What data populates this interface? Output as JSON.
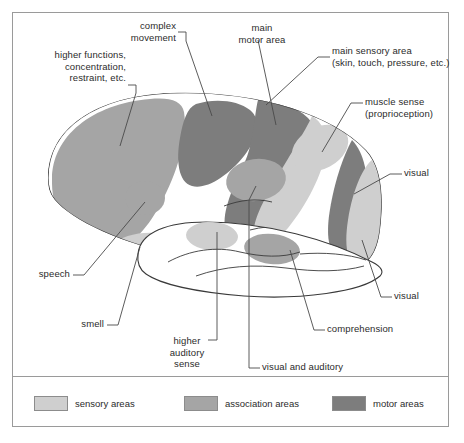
{
  "figure": {
    "frame_border_color": "#9a9a9a",
    "background_color": "#ffffff",
    "outline_color": "#3a3a3a"
  },
  "colors": {
    "sensory": "#cfcfcf",
    "association": "#a5a5a5",
    "motor": "#7d7d7d",
    "white_matter": "#ffffff",
    "stroke": "#3a3a3a",
    "leader_line": "#4a4a4a",
    "text": "#2b2b2b"
  },
  "labels": [
    {
      "name": "higher-functions",
      "text": "higher functions,\nconcentration,\nrestraint, etc.",
      "align": "right",
      "x": 20,
      "y": 49,
      "width": 106
    },
    {
      "name": "complex-movement",
      "text": "complex\nmovement",
      "align": "right",
      "x": 104,
      "y": 20,
      "width": 72
    },
    {
      "name": "main-motor-area",
      "text": "main\nmotor area",
      "align": "center",
      "x": 231,
      "y": 22,
      "width": 62
    },
    {
      "name": "main-sensory-area",
      "text": "main sensory area\n(skin, touch, pressure, etc.)",
      "align": "left",
      "x": 332,
      "y": 45,
      "width": 128
    },
    {
      "name": "muscle-sense",
      "text": "muscle sense\n(proprioception)",
      "align": "left",
      "x": 365,
      "y": 96,
      "width": 96
    },
    {
      "name": "visual-upper",
      "text": "visual",
      "align": "left",
      "x": 404,
      "y": 167,
      "width": 44
    },
    {
      "name": "visual-lower",
      "text": "visual",
      "align": "left",
      "x": 394,
      "y": 290,
      "width": 44
    },
    {
      "name": "comprehension",
      "text": "comprehension",
      "align": "left",
      "x": 327,
      "y": 323,
      "width": 86
    },
    {
      "name": "visual-and-auditory",
      "text": "visual and auditory",
      "align": "left",
      "x": 262,
      "y": 361,
      "width": 104
    },
    {
      "name": "higher-auditory-sense",
      "text": "higher\nauditory\nsense",
      "align": "center",
      "x": 160,
      "y": 335,
      "width": 54
    },
    {
      "name": "smell",
      "text": "smell",
      "align": "right",
      "x": 60,
      "y": 318,
      "width": 44
    },
    {
      "name": "speech",
      "text": "speech",
      "align": "right",
      "x": 22,
      "y": 268,
      "width": 48
    }
  ],
  "legend": {
    "items": [
      {
        "name": "sensory-areas",
        "label": "sensory areas",
        "color": "#cfcfcf",
        "x": 22
      },
      {
        "name": "association-areas",
        "label": "association areas",
        "color": "#a5a5a5",
        "x": 172
      },
      {
        "name": "motor-areas",
        "label": "motor areas",
        "color": "#7d7d7d",
        "x": 320
      }
    ]
  },
  "regions": [
    {
      "name": "prefrontal-association",
      "category": "association",
      "label_ref": "higher-functions"
    },
    {
      "name": "premotor-complex-movement",
      "category": "motor",
      "label_ref": "complex-movement"
    },
    {
      "name": "primary-motor-cortex",
      "category": "motor",
      "label_ref": "main-motor-area"
    },
    {
      "name": "primary-somatosensory-cortex",
      "category": "sensory",
      "label_ref": "main-sensory-area"
    },
    {
      "name": "proprioception-area",
      "category": "sensory",
      "label_ref": "muscle-sense"
    },
    {
      "name": "visual-association-upper",
      "category": "association",
      "label_ref": "visual-upper"
    },
    {
      "name": "primary-visual-cortex",
      "category": "sensory",
      "label_ref": "visual-lower"
    },
    {
      "name": "occipital-motor-band",
      "category": "motor",
      "label_ref": "visual-upper"
    },
    {
      "name": "comprehension-area",
      "category": "association",
      "label_ref": "comprehension"
    },
    {
      "name": "visual-and-auditory-area",
      "category": "association",
      "label_ref": "visual-and-auditory"
    },
    {
      "name": "higher-auditory-area",
      "category": "sensory",
      "label_ref": "higher-auditory-sense"
    },
    {
      "name": "speech-area",
      "category": "association",
      "label_ref": "speech"
    },
    {
      "name": "smell-area",
      "category": "sensory",
      "label_ref": "smell"
    }
  ]
}
